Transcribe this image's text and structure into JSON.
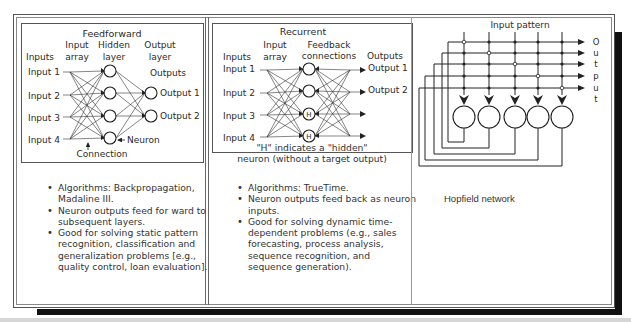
{
  "feedforward": {
    "title": "Feedforward",
    "labels": {
      "inputs": "Inputs",
      "input_array_1": "Input",
      "input_array_2": "array",
      "hidden_1": "Hidden",
      "hidden_2": "layer",
      "output_layer_1": "Output",
      "output_layer_2": "layer",
      "outputs": "Outputs",
      "neuron": "Neuron",
      "connection": "Connection"
    },
    "inputs": [
      "Input 1",
      "Input 2",
      "Input 3",
      "Input 4"
    ],
    "outputs": [
      "Output 1",
      "Output 2"
    ],
    "bullets": [
      "Algorithms:  Backpropagation, Madaline III.",
      "Neuron outputs feed for  ward to subsequent layers.",
      "Good for solving static pattern recognition, classification and generalization problems [e.g., quality control, loan evaluation]."
    ]
  },
  "recurrent": {
    "title": "Recurrent",
    "labels": {
      "inputs": "Inputs",
      "input_array_1": "Input",
      "input_array_2": "array",
      "feedback_1": "Feedback",
      "feedback_2": "connections",
      "outputs": "Outputs",
      "hidden_marker": "H"
    },
    "inputs": [
      "Input 1",
      "Input 2",
      "Input 3",
      "Input 4"
    ],
    "outputs": [
      "Output 1",
      "Output 2"
    ],
    "note_line1": "\"H\" indicates a \"hidden\"",
    "note_line2": "neuron (without a target output)",
    "bullets": [
      "Algorithms: TrueTime.",
      "Neuron outputs feed back as neuron inputs.",
      "Good for solving dynamic time-dependent problems (e.g., sales forecasting, process analysis, sequence recognition, and sequence generation)."
    ]
  },
  "hopfield": {
    "title": "Input pattern",
    "output_letters": [
      "O",
      "u",
      "t",
      "p",
      "u",
      "t"
    ],
    "caption": "Hopfield network"
  }
}
